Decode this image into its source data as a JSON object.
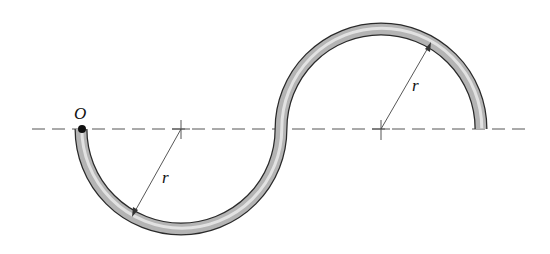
{
  "diagram": {
    "origin_label": "O",
    "radius_label_left": "r",
    "radius_label_right": "r",
    "colors": {
      "tube_fill": "#b8b8b8",
      "tube_highlight": "#e6e6e6",
      "tube_outline": "#333333",
      "axis": "#555555",
      "dimension_line": "#444444"
    }
  }
}
